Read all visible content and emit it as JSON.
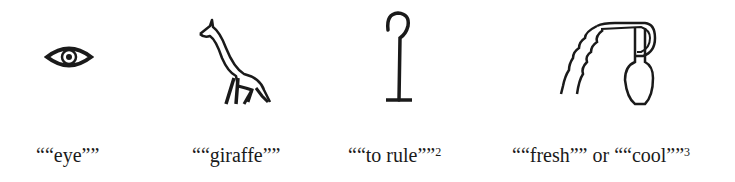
{
  "figure": {
    "items": [
      {
        "glyph": "eye-hieroglyph",
        "label": "““eye””",
        "note": ""
      },
      {
        "glyph": "giraffe-hieroglyph",
        "label": "““giraffe””",
        "note": ""
      },
      {
        "glyph": "crook-hieroglyph",
        "label": "““to rule””",
        "note": "2"
      },
      {
        "glyph": "water-jar-hieroglyph",
        "label": "““fresh”” or ““cool””",
        "note": "3"
      }
    ],
    "ink_color": "#1a1a1a",
    "background": "#ffffff"
  }
}
